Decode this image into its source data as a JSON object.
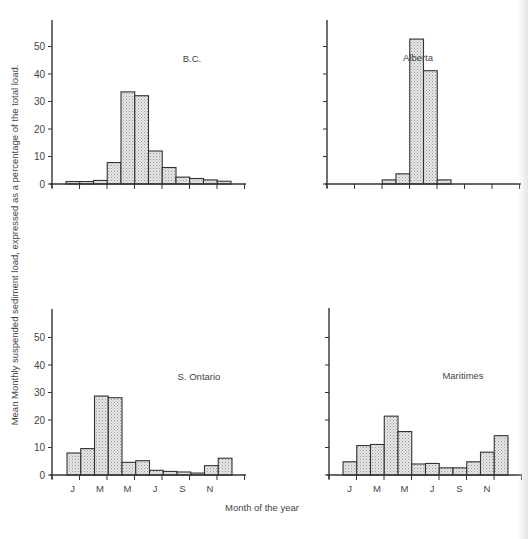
{
  "figure": {
    "ylabel": "Mean Monthly suspended sediment load, expressed as a percentage of the total load.",
    "xlabel": "Month of the year",
    "bar_fill": "#dcdcdc",
    "bar_stroke": "#333333",
    "axis_color": "#333333"
  },
  "chart_data": [
    {
      "type": "bar",
      "title": "B.C.",
      "categories": [
        "J",
        "F",
        "M",
        "A",
        "M",
        "J",
        "J",
        "A",
        "S",
        "O",
        "N",
        "D"
      ],
      "values": [
        0.9,
        0.9,
        1.3,
        7.8,
        33.5,
        32.1,
        12.0,
        6.0,
        2.5,
        2.0,
        1.5,
        1.0
      ],
      "xlabel": "Month of the year",
      "ylabel": "Mean Monthly suspended sediment load, expressed as a percentage of the total load.",
      "yticks": [
        0,
        10,
        20,
        30,
        40,
        50
      ],
      "ytick_labels_shown": true,
      "xtick_labels": [],
      "ylim": [
        0,
        60
      ],
      "grid": false
    },
    {
      "type": "bar",
      "title": "Alberta",
      "categories": [
        "J",
        "F",
        "M",
        "A",
        "M",
        "J",
        "J",
        "A",
        "S",
        "O",
        "N",
        "D"
      ],
      "values": [
        0,
        0,
        0,
        1.5,
        3.7,
        52.7,
        41.2,
        1.5,
        0,
        0,
        0,
        0
      ],
      "xlabel": "Month of the year",
      "yticks": [
        0,
        10,
        20,
        30,
        40,
        50
      ],
      "ytick_labels_shown": false,
      "xtick_labels": [],
      "ylim": [
        0,
        60
      ],
      "grid": false
    },
    {
      "type": "bar",
      "title": "S. Ontario",
      "categories": [
        "J",
        "F",
        "M",
        "A",
        "M",
        "J",
        "J",
        "A",
        "S",
        "O",
        "N",
        "D"
      ],
      "values": [
        8.0,
        9.6,
        28.7,
        28.1,
        4.6,
        5.2,
        1.7,
        1.3,
        1.1,
        0.7,
        3.4,
        6.1
      ],
      "xlabel": "Month of the year",
      "ylabel": "Mean Monthly suspended sediment load, expressed as a percentage of the total load.",
      "yticks": [
        0,
        10,
        20,
        30,
        40,
        50
      ],
      "ytick_labels_shown": true,
      "xtick_labels": [
        "J",
        "M",
        "M",
        "J",
        "S",
        "N"
      ],
      "ylim": [
        0,
        60
      ],
      "grid": false
    },
    {
      "type": "bar",
      "title": "Maritimes",
      "categories": [
        "J",
        "F",
        "M",
        "A",
        "M",
        "J",
        "J",
        "A",
        "S",
        "O",
        "N",
        "D"
      ],
      "values": [
        4.8,
        10.7,
        11.1,
        21.4,
        15.8,
        4.0,
        4.2,
        2.6,
        2.6,
        4.8,
        8.3,
        14.3
      ],
      "xlabel": "Month of the year",
      "yticks": [
        0,
        10,
        20,
        30,
        40,
        50
      ],
      "ytick_labels_shown": false,
      "xtick_labels": [
        "J",
        "M",
        "M",
        "J",
        "S",
        "N"
      ],
      "ylim": [
        0,
        60
      ],
      "grid": false
    }
  ],
  "panels": [
    {
      "title": "B.C.",
      "title_x": 192,
      "title_y": 62,
      "origin_x": 52,
      "zero_y": 184,
      "top_y": 20,
      "axis_end_x": 246,
      "bar_start_x": 66,
      "show_ytick_labels": true,
      "show_xtick_labels": false
    },
    {
      "title": "Alberta",
      "title_x": 418,
      "title_y": 61,
      "origin_x": 327,
      "zero_y": 184,
      "top_y": 20,
      "axis_end_x": 521,
      "bar_start_x": 341,
      "show_ytick_labels": false,
      "show_xtick_labels": false
    },
    {
      "title": "S. Ontario",
      "title_x": 199,
      "title_y": 380,
      "origin_x": 52,
      "zero_y": 475,
      "top_y": 309,
      "axis_end_x": 246,
      "bar_start_x": 67,
      "show_ytick_labels": true,
      "show_xtick_labels": true
    },
    {
      "title": "Maritimes",
      "title_x": 463,
      "title_y": 379,
      "origin_x": 329,
      "zero_y": 475,
      "top_y": 308,
      "axis_end_x": 522,
      "bar_start_x": 343,
      "show_ytick_labels": false,
      "show_xtick_labels": true
    }
  ]
}
